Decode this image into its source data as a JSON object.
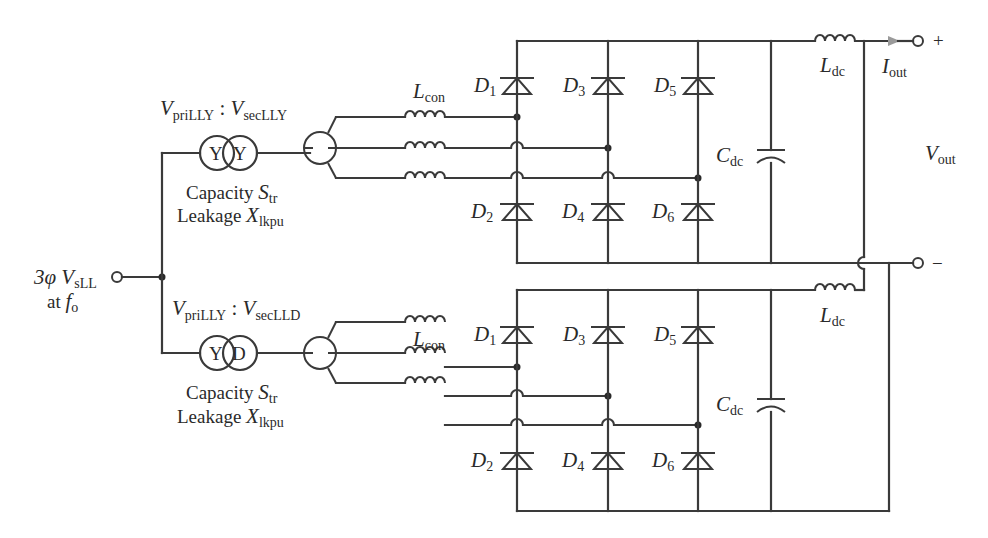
{
  "diagram": {
    "input": {
      "label_main": "3φ V",
      "label_sub": "sLL",
      "freq_prefix": "at ",
      "freq_main": "f",
      "freq_sub": "o"
    },
    "transformer_top": {
      "ratio_pri_main": "V",
      "ratio_pri_sub": "priLLY",
      "ratio_sep": " : ",
      "ratio_sec_main": "V",
      "ratio_sec_sub": "secLLY",
      "primary": "Y",
      "secondary": "Y",
      "capacity_text": "Capacity ",
      "capacity_sym": "S",
      "capacity_sub": "tr",
      "leakage_text": "Leakage ",
      "leakage_sym": "X",
      "leakage_sub": "lkpu"
    },
    "transformer_bottom": {
      "ratio_pri_main": "V",
      "ratio_pri_sub": "priLLY",
      "ratio_sep": " : ",
      "ratio_sec_main": "V",
      "ratio_sec_sub": "secLLD",
      "primary": "Y",
      "secondary": "D",
      "capacity_text": "Capacity ",
      "capacity_sym": "S",
      "capacity_sub": "tr",
      "leakage_text": "Leakage ",
      "leakage_sym": "X",
      "leakage_sub": "lkpu"
    },
    "bridge_top": {
      "lcon_main": "L",
      "lcon_sub": "con",
      "diodes": [
        {
          "main": "D",
          "sub": "1"
        },
        {
          "main": "D",
          "sub": "3"
        },
        {
          "main": "D",
          "sub": "5"
        },
        {
          "main": "D",
          "sub": "2"
        },
        {
          "main": "D",
          "sub": "4"
        },
        {
          "main": "D",
          "sub": "6"
        }
      ],
      "cap_main": "C",
      "cap_sub": "dc",
      "ldc_main": "L",
      "ldc_sub": "dc"
    },
    "bridge_bottom": {
      "lcon_main": "L",
      "lcon_sub": "con",
      "diodes": [
        {
          "main": "D",
          "sub": "1"
        },
        {
          "main": "D",
          "sub": "3"
        },
        {
          "main": "D",
          "sub": "5"
        },
        {
          "main": "D",
          "sub": "2"
        },
        {
          "main": "D",
          "sub": "4"
        },
        {
          "main": "D",
          "sub": "6"
        }
      ],
      "cap_main": "C",
      "cap_sub": "dc",
      "ldc_main": "L",
      "ldc_sub": "dc"
    },
    "output": {
      "plus": "+",
      "minus": "−",
      "iout_main": "I",
      "iout_sub": "out",
      "vout_main": "V",
      "vout_sub": "out",
      "arrow_color": "#9a9a9a"
    },
    "colors": {
      "wire": "#3a3a3a",
      "text": "#2a2a2a",
      "background": "#ffffff"
    }
  }
}
